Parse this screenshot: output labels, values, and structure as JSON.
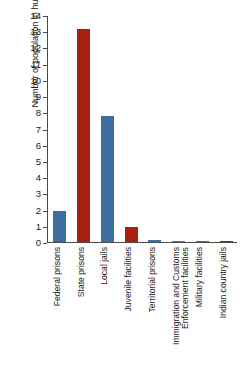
{
  "chart_data": {
    "type": "bar",
    "title": "",
    "xlabel": "",
    "ylabel": "Number of population in hundreds of thousands",
    "ylim": [
      0,
      14
    ],
    "ytick_labels": [
      "0",
      "1",
      "2",
      "3",
      "4",
      "5",
      "6",
      "7",
      "8",
      "9",
      "10",
      "11",
      "12",
      "13",
      "14"
    ],
    "grid": false,
    "legend": "none",
    "categories": [
      "Federal prisons",
      "State prisons",
      "Local jails",
      "Juvenile facilities",
      "Territorial prisons",
      "Immigration and Customs Enforcement facilities",
      "Military facilities",
      "Indian country jails"
    ],
    "category_lines": [
      [
        "Federal prisons"
      ],
      [
        "State prisons"
      ],
      [
        "Local jails"
      ],
      [
        "Juvenile facilities"
      ],
      [
        "Territorial prisons"
      ],
      [
        "Immigration and Customs",
        "Enforcement facilities"
      ],
      [
        "Military facilities"
      ],
      [
        "Indian country jails"
      ]
    ],
    "values": [
      1.9,
      13.2,
      7.8,
      0.9,
      0.12,
      0.08,
      0.04,
      0.03
    ],
    "bar_colors": [
      "#3a6f9f",
      "#a82010",
      "#3a6f9f",
      "#a82010",
      "#3a6f9f",
      "#a8601c",
      "#3a6f9f",
      "#a82010"
    ]
  },
  "colors": {
    "blue": "#3a6f9f",
    "red": "#a82010",
    "orange": "#a8601c",
    "axis": "#4a4a4a",
    "text": "#1a1a1a",
    "background": "#ffffff"
  }
}
